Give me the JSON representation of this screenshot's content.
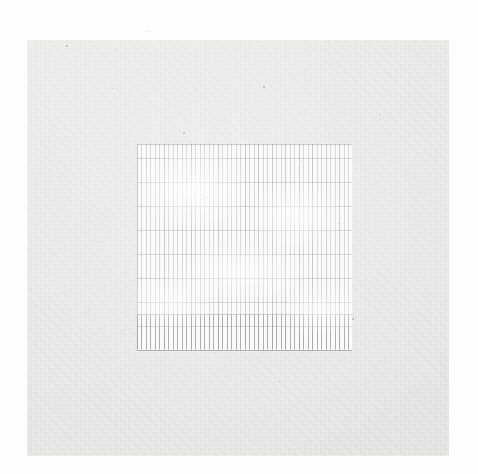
{
  "image": {
    "kind": "scanned-document",
    "description": "Extremely faded scan of a ruled ledger / tabular sheet on a light gray paper panel",
    "width": 478,
    "height": 474,
    "background_color": "#fefefe"
  },
  "paper_panel": {
    "name": "paper-panel",
    "fill_color": "#e4e4e2",
    "x": 27,
    "y": 40,
    "width": 422,
    "height": 416,
    "legible_text": ""
  },
  "ruled_region": {
    "name": "ruled-table-region",
    "fill_color": "#fbfbfa",
    "x": 137,
    "y": 144,
    "width": 215,
    "height": 207,
    "column_rule_color": "#969696",
    "row_rule_color": "#8c8c8c",
    "column_pitch_px": 4.5,
    "row_pitch_px": 24,
    "legible_text": "",
    "header_rule_label": "",
    "footer_rule_label": "",
    "bottom_band_label": ""
  },
  "specks": [
    {
      "x": 66,
      "y": 45,
      "size": 1.6
    },
    {
      "x": 112,
      "y": 88,
      "size": 1.3
    },
    {
      "x": 148,
      "y": 31,
      "size": 1.4
    },
    {
      "x": 183,
      "y": 132,
      "size": 1.5
    },
    {
      "x": 59,
      "y": 176,
      "size": 1.2
    },
    {
      "x": 206,
      "y": 197,
      "size": 1.4
    },
    {
      "x": 97,
      "y": 241,
      "size": 1.3
    },
    {
      "x": 263,
      "y": 86,
      "size": 1.5
    },
    {
      "x": 301,
      "y": 160,
      "size": 1.2
    },
    {
      "x": 338,
      "y": 223,
      "size": 1.4
    },
    {
      "x": 380,
      "y": 119,
      "size": 1.3
    },
    {
      "x": 352,
      "y": 318,
      "size": 1.5
    },
    {
      "x": 214,
      "y": 352,
      "size": 1.3
    },
    {
      "x": 123,
      "y": 330,
      "size": 1.4
    },
    {
      "x": 279,
      "y": 381,
      "size": 1.2
    }
  ]
}
